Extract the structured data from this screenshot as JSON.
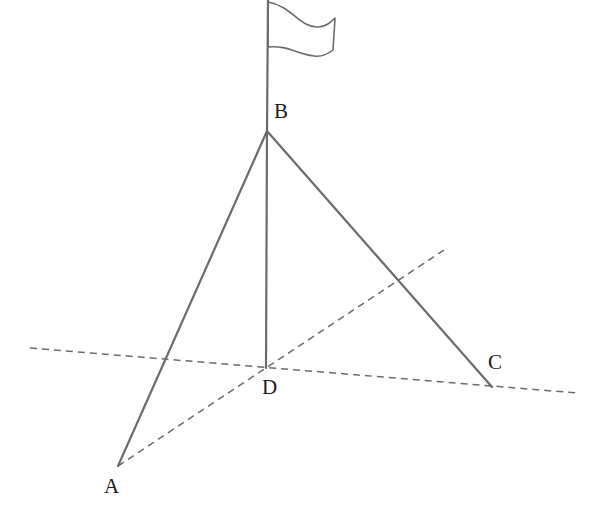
{
  "figure": {
    "background_color": "#ffffff",
    "stroke_color": "#6b6b6b",
    "label_color": "#1b1b1b",
    "width": 607,
    "height": 510
  },
  "labels": {
    "a": "A",
    "b": "B",
    "c": "C",
    "d": "D"
  },
  "points": {
    "A": {
      "x": 118,
      "y": 466
    },
    "B": {
      "x": 267,
      "y": 131
    },
    "C": {
      "x": 492,
      "y": 387
    },
    "D": {
      "x": 266,
      "y": 368
    }
  },
  "label_positions": {
    "A": {
      "x": 104,
      "y": 476
    },
    "B": {
      "x": 274,
      "y": 101
    },
    "C": {
      "x": 488,
      "y": 352
    },
    "D": {
      "x": 262,
      "y": 377
    }
  },
  "segments": {
    "pole": {
      "from": {
        "x": 268,
        "y": 0
      },
      "to": {
        "x": 267,
        "y": 131
      },
      "style": "solid"
    },
    "BA": {
      "from": {
        "x": 267,
        "y": 131
      },
      "to": {
        "x": 118,
        "y": 466
      },
      "style": "solid"
    },
    "BD": {
      "from": {
        "x": 267,
        "y": 131
      },
      "to": {
        "x": 266,
        "y": 368
      },
      "style": "solid"
    },
    "BC": {
      "from": {
        "x": 267,
        "y": 131
      },
      "to": {
        "x": 492,
        "y": 387
      },
      "style": "solid"
    },
    "ground_line": {
      "from": {
        "x": 30,
        "y": 348
      },
      "to": {
        "x": 577,
        "y": 393
      },
      "style": "dashed"
    },
    "AD_extended": {
      "from": {
        "x": 118,
        "y": 466
      },
      "to": {
        "x": 447,
        "y": 248
      },
      "style": "dashed"
    }
  },
  "flag": {
    "attach_top": {
      "x": 268,
      "y": 2
    },
    "attach_bottom": {
      "x": 268,
      "y": 47
    },
    "path": "M 268 2 C 292 6 300 28 318 27 C 326 27 331 22 335 18 L 333 50 C 328 54 322 57 314 56 C 296 54 288 45 268 47 Z",
    "style": "outline"
  },
  "dash_pattern": "7 5",
  "stroke_widths": {
    "solid": 2.2,
    "dashed": 1.5,
    "flag": 1.6
  }
}
